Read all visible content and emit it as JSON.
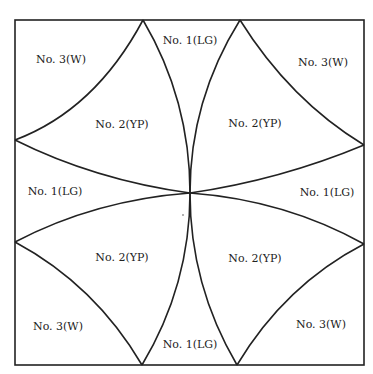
{
  "diagram": {
    "labels": [
      {
        "id": "tl-w",
        "text": "No. 3(W)",
        "x": 61,
        "y": 59
      },
      {
        "id": "top-lg",
        "text": "No. 1(LG)",
        "x": 190,
        "y": 40
      },
      {
        "id": "tr-w",
        "text": "No. 3(W)",
        "x": 323,
        "y": 62
      },
      {
        "id": "tl-yp",
        "text": "No. 2(YP)",
        "x": 122,
        "y": 124
      },
      {
        "id": "tr-yp",
        "text": "No. 2(YP)",
        "x": 255,
        "y": 123
      },
      {
        "id": "left-lg",
        "text": "No. 1(LG)",
        "x": 55,
        "y": 191
      },
      {
        "id": "right-lg",
        "text": "No. 1(LG)",
        "x": 327,
        "y": 192
      },
      {
        "id": "bl-yp",
        "text": "No. 2(YP)",
        "x": 122,
        "y": 257
      },
      {
        "id": "br-yp",
        "text": "No. 2(YP)",
        "x": 255,
        "y": 258
      },
      {
        "id": "bl-w",
        "text": "No. 3(W)",
        "x": 58,
        "y": 326
      },
      {
        "id": "bottom-lg",
        "text": "No. 1(LG)",
        "x": 190,
        "y": 344
      },
      {
        "id": "br-w",
        "text": "No. 3(W)",
        "x": 321,
        "y": 324
      }
    ]
  }
}
